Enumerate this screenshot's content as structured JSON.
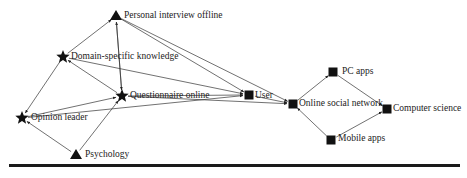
{
  "diagram": {
    "type": "directed-network",
    "node_shapes": {
      "star": "star-icon",
      "triangle": "triangle-icon",
      "square": "square-icon"
    },
    "colors": {
      "node": "#111111",
      "edge": "#333333",
      "text": "#222222",
      "rule": "#1a1a1a"
    },
    "nodes": [
      {
        "id": "personal_interview_offline",
        "label": "Personal interview offline",
        "shape": "triangle",
        "x": 116,
        "y": 16
      },
      {
        "id": "domain_specific_knowledge",
        "label": "Domain-specific knowledge",
        "shape": "star",
        "x": 63,
        "y": 57
      },
      {
        "id": "questionnaire_online",
        "label": "Questionnaire online",
        "shape": "star",
        "x": 122,
        "y": 96
      },
      {
        "id": "opinion_leader",
        "label": "Opinion leader",
        "shape": "star",
        "x": 22,
        "y": 118
      },
      {
        "id": "psychology",
        "label": "Psychology",
        "shape": "triangle",
        "x": 76,
        "y": 155
      },
      {
        "id": "user",
        "label": "User",
        "shape": "square",
        "x": 249,
        "y": 95
      },
      {
        "id": "online_social_network",
        "label": "Online social network",
        "shape": "square",
        "x": 293,
        "y": 104
      },
      {
        "id": "pc_apps",
        "label": "PC apps",
        "shape": "square",
        "x": 333,
        "y": 72
      },
      {
        "id": "computer_science",
        "label": "Computer science",
        "shape": "square",
        "x": 387,
        "y": 109
      },
      {
        "id": "mobile_apps",
        "label": "Mobile apps",
        "shape": "square",
        "x": 331,
        "y": 140
      }
    ],
    "edges": [
      {
        "from": "domain_specific_knowledge",
        "to": "personal_interview_offline"
      },
      {
        "from": "questionnaire_online",
        "to": "personal_interview_offline"
      },
      {
        "from": "personal_interview_offline",
        "to": "questionnaire_online"
      },
      {
        "from": "personal_interview_offline",
        "to": "user"
      },
      {
        "from": "personal_interview_offline",
        "to": "online_social_network"
      },
      {
        "from": "domain_specific_knowledge",
        "to": "opinion_leader"
      },
      {
        "from": "questionnaire_online",
        "to": "domain_specific_knowledge"
      },
      {
        "from": "domain_specific_knowledge",
        "to": "user"
      },
      {
        "from": "opinion_leader",
        "to": "questionnaire_online"
      },
      {
        "from": "questionnaire_online",
        "to": "user"
      },
      {
        "from": "opinion_leader",
        "to": "user"
      },
      {
        "from": "questionnaire_online",
        "to": "online_social_network"
      },
      {
        "from": "psychology",
        "to": "opinion_leader"
      },
      {
        "from": "psychology",
        "to": "questionnaire_online"
      },
      {
        "from": "user",
        "to": "online_social_network"
      },
      {
        "from": "online_social_network",
        "to": "pc_apps"
      },
      {
        "from": "mobile_apps",
        "to": "online_social_network"
      },
      {
        "from": "pc_apps",
        "to": "computer_science"
      },
      {
        "from": "mobile_apps",
        "to": "computer_science"
      }
    ]
  },
  "labels": {
    "personal_interview_offline": "Personal interview offline",
    "domain_specific_knowledge": "Domain-specific knowledge",
    "questionnaire_online": "Questionnaire online",
    "opinion_leader": "Opinion leader",
    "psychology": "Psychology",
    "user": "User",
    "online_social_network": "Online social network",
    "pc_apps": "PC apps",
    "computer_science": "Computer science",
    "mobile_apps": "Mobile apps"
  }
}
